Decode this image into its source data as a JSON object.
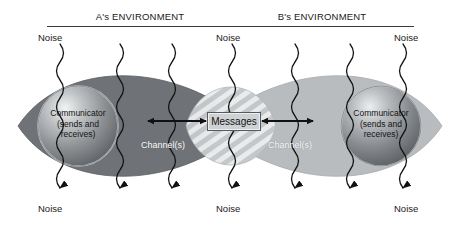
{
  "diagram": {
    "environments": [
      {
        "id": "a",
        "label": "A's ENVIRONMENT"
      },
      {
        "id": "b",
        "label": "B's ENVIRONMENT"
      }
    ],
    "noise_labels_top": [
      "Noise",
      "Noise",
      "Noise"
    ],
    "noise_labels_bottom": [
      "Noise",
      "Noise",
      "Noise"
    ],
    "communicators": [
      {
        "id": "a",
        "line1": "Communicator",
        "line2": "(sends and",
        "line3": "receives)"
      },
      {
        "id": "b",
        "line1": "Communicator",
        "line2": "(sends and",
        "line3": "receives)"
      }
    ],
    "channels": [
      {
        "id": "left",
        "label": "Channel(s)"
      },
      {
        "id": "right",
        "label": "Channel(s)"
      }
    ],
    "messages": {
      "label": "Messages"
    },
    "colors": {
      "background": "#ffffff",
      "lens_a": "#6f7276",
      "lens_b": "#b9bcbe",
      "overlap_stripe_light": "#e7e9ea",
      "overlap_stripe_dark": "#c6c9cb",
      "circle_edge": "#4b4e52",
      "circle_highlight": "#d9dcdd",
      "noise_line": "#1a1a1a",
      "rule": "#3a3a3a",
      "text": "#1a1a1a",
      "messages_fill": "#cfd2d4",
      "messages_border": "#555a5e"
    },
    "noise_line_x": [
      60,
      120,
      172,
      232,
      295,
      350,
      403
    ],
    "arrows": {
      "left": {
        "label": "bidirectional-arrow-left"
      },
      "right": {
        "label": "bidirectional-arrow-right"
      }
    }
  }
}
